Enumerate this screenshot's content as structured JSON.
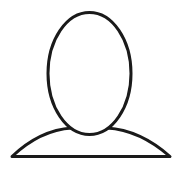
{
  "avatar": {
    "icon": "default-user-avatar-placeholder-icon",
    "stroke_color": "#1a1a1a",
    "fill_color": "#ffffff",
    "background_color": "#ffffff"
  }
}
